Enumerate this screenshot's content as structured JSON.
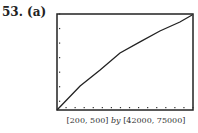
{
  "problem": {
    "number": "53.",
    "part": "(a)"
  },
  "window_caption": {
    "x_range": "[200, 500]",
    "by": "by",
    "y_range": "[42000, 75000]"
  },
  "chart_data": {
    "type": "line",
    "title": "",
    "xlabel": "",
    "ylabel": "",
    "xlim": [
      200,
      500
    ],
    "ylim": [
      42000,
      75000
    ],
    "x_tick_step": 20,
    "y_tick_step": 5000,
    "grid": false,
    "legend": null,
    "series": [
      {
        "name": "curve",
        "x": [
          200,
          251,
          295,
          339,
          383,
          427,
          471,
          498
        ],
        "y": [
          42000,
          50250,
          55750,
          61600,
          65400,
          69150,
          72250,
          74650
        ]
      }
    ]
  }
}
